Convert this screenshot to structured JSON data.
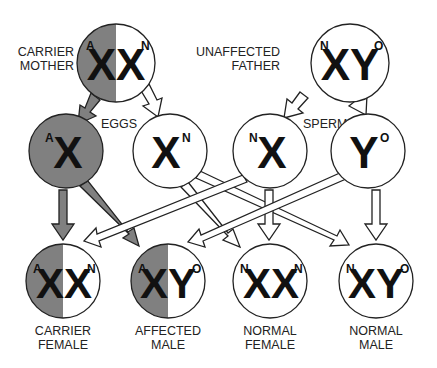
{
  "colors": {
    "affected_gray": "#808080",
    "outline": "#222222",
    "background": "#ffffff"
  },
  "parents": {
    "mother": {
      "label_line1": "CARRIER",
      "label_line2": "MOTHER",
      "pre": "A",
      "letters": "XX",
      "post": "N"
    },
    "father": {
      "label_line1": "UNAFFECTED",
      "label_line2": "FATHER",
      "pre": "N",
      "letters": "XY",
      "post": "O"
    }
  },
  "gametes": {
    "eggs_label": "EGGS",
    "sperm_label": "SPERM",
    "egg_affected": {
      "pre": "A",
      "letter": "X",
      "post": ""
    },
    "egg_normal": {
      "pre": "",
      "letter": "X",
      "post": "N"
    },
    "sperm_x": {
      "pre": "N",
      "letter": "X",
      "post": ""
    },
    "sperm_y": {
      "pre": "",
      "letter": "Y",
      "post": "O"
    }
  },
  "offspring": [
    {
      "pre": "A",
      "letters": "XX",
      "post": "N",
      "label_line1": "CARRIER",
      "label_line2": "FEMALE"
    },
    {
      "pre": "A",
      "letters": "XY",
      "post": "O",
      "label_line1": "AFFECTED",
      "label_line2": "MALE"
    },
    {
      "pre": "N",
      "letters": "XX",
      "post": "N",
      "label_line1": "NORMAL",
      "label_line2": "FEMALE"
    },
    {
      "pre": "N",
      "letters": "XY",
      "post": "O",
      "label_line1": "NORMAL",
      "label_line2": "MALE"
    }
  ]
}
